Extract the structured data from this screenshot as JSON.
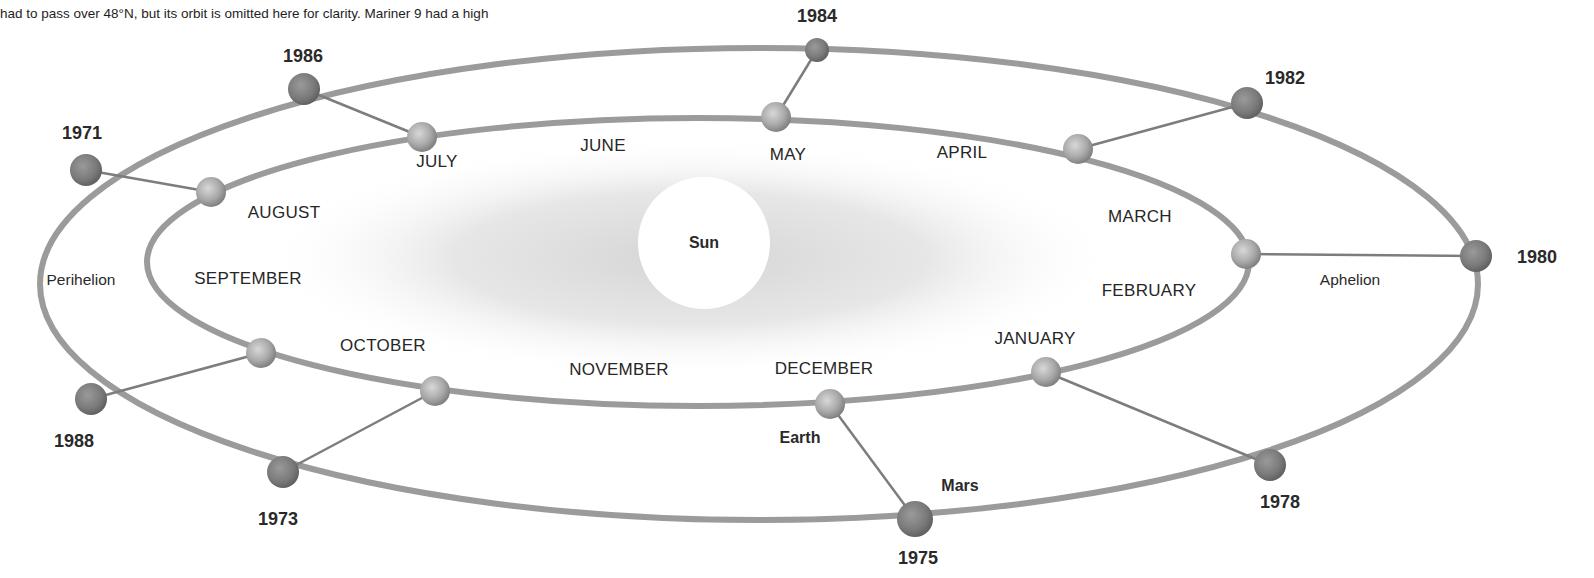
{
  "caption": {
    "line1_partial": "",
    "line2": "had to pass over 48°N, but its orbit is omitted here for clarity. Mariner 9 had a high",
    "right_partial": ""
  },
  "sun": {
    "label": "Sun",
    "cx": 704,
    "cy": 243,
    "r": 66,
    "color": "#ffffff"
  },
  "orbits": {
    "earth": {
      "label": "Earth",
      "cx": 698,
      "cy": 262,
      "rx": 551,
      "ry": 144,
      "stroke": "#9a9a9a"
    },
    "mars": {
      "label": "Mars",
      "cx": 759,
      "cy": 284,
      "rx": 719,
      "ry": 236,
      "stroke": "#9a9a9a"
    }
  },
  "labels": {
    "earth": "Earth",
    "mars": "Mars",
    "perihelion": "Perihelion",
    "aphelion": "Aphelion"
  },
  "months": [
    {
      "name": "JANUARY",
      "x": 1035,
      "y": 339
    },
    {
      "name": "FEBRUARY",
      "x": 1149,
      "y": 291
    },
    {
      "name": "MARCH",
      "x": 1140,
      "y": 217
    },
    {
      "name": "APRIL",
      "x": 962,
      "y": 153
    },
    {
      "name": "MAY",
      "x": 788,
      "y": 155
    },
    {
      "name": "JUNE",
      "x": 603,
      "y": 146
    },
    {
      "name": "JULY",
      "x": 437,
      "y": 162
    },
    {
      "name": "AUGUST",
      "x": 284,
      "y": 213
    },
    {
      "name": "SEPTEMBER",
      "x": 248,
      "y": 279
    },
    {
      "name": "OCTOBER",
      "x": 383,
      "y": 346
    },
    {
      "name": "NOVEMBER",
      "x": 619,
      "y": 370
    },
    {
      "name": "DECEMBER",
      "x": 824,
      "y": 369
    }
  ],
  "oppositions": [
    {
      "year": "1971",
      "earth_x": 211,
      "earth_y": 192,
      "mars_x": 86,
      "mars_y": 170,
      "label_x": 82,
      "label_y": 133
    },
    {
      "year": "1973",
      "earth_x": 435,
      "earth_y": 391,
      "mars_x": 283,
      "mars_y": 472,
      "label_x": 278,
      "label_y": 519
    },
    {
      "year": "1975",
      "earth_x": 830,
      "earth_y": 404,
      "mars_x": 915,
      "mars_y": 519,
      "label_x": 918,
      "label_y": 558
    },
    {
      "year": "1978",
      "earth_x": 1046,
      "earth_y": 372,
      "mars_x": 1270,
      "mars_y": 465,
      "label_x": 1280,
      "label_y": 502
    },
    {
      "year": "1980",
      "earth_x": 1246,
      "earth_y": 254,
      "mars_x": 1476,
      "mars_y": 256,
      "label_x": 1537,
      "label_y": 257
    },
    {
      "year": "1982",
      "earth_x": 1078,
      "earth_y": 149,
      "mars_x": 1247,
      "mars_y": 103,
      "label_x": 1285,
      "label_y": 78
    },
    {
      "year": "1984",
      "earth_x": 776,
      "earth_y": 117,
      "mars_x": 817,
      "mars_y": 50,
      "label_x": 817,
      "label_y": 16
    },
    {
      "year": "1986",
      "earth_x": 422,
      "earth_y": 137,
      "mars_x": 304,
      "mars_y": 89,
      "label_x": 303,
      "label_y": 56
    },
    {
      "year": "1988",
      "earth_x": 261,
      "earth_y": 353,
      "mars_x": 91,
      "mars_y": 399,
      "label_x": 74,
      "label_y": 441
    }
  ],
  "colors": {
    "orbit_stroke": "#9b9b9b",
    "connector": "#7d7d7d",
    "mars_fill": "#7a7a7a",
    "earth_fill": "#a8a8a8",
    "glow": "#d9d9d9"
  }
}
